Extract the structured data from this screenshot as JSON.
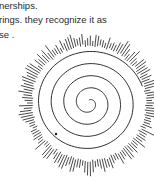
{
  "document": {
    "lines": [
      "nerships.",
      "rings. they recognize it as",
      "se ."
    ]
  },
  "figure": {
    "icon": "spiral-illustration"
  }
}
